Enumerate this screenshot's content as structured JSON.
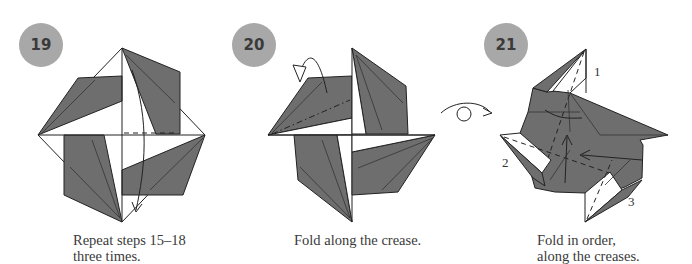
{
  "steps": [
    {
      "number": "19",
      "caption_line1": "Repeat steps 15–18",
      "caption_line2": "three times."
    },
    {
      "number": "20",
      "caption_line1": "Fold along the crease."
    },
    {
      "number": "21",
      "caption_line1": "Fold in order,",
      "caption_line2": "along the creases.",
      "fold_labels": [
        "1",
        "2",
        "3"
      ]
    }
  ],
  "transition_symbol": "turn-over-icon",
  "colors": {
    "badge": "#a8a8a8",
    "paper_colored": "#6e6e6e",
    "paper_white": "#ffffff",
    "line": "#222222"
  }
}
